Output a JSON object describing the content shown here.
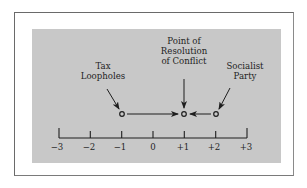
{
  "diagram": {
    "type": "number-line",
    "axis": {
      "ticks": [
        {
          "value": -3,
          "label": "−3"
        },
        {
          "value": -2,
          "label": "−2"
        },
        {
          "value": -1,
          "label": "−1"
        },
        {
          "value": 0,
          "label": "0"
        },
        {
          "value": 1,
          "label": "+1"
        },
        {
          "value": 2,
          "label": "+2"
        },
        {
          "value": 3,
          "label": "+3"
        }
      ]
    },
    "points": [
      {
        "id": "tax-loopholes",
        "position": -1,
        "label_line1": "Tax",
        "label_line2": "Loopholes"
      },
      {
        "id": "resolution",
        "position": 1,
        "label_line1": "Point of",
        "label_line2": "Resolution",
        "label_line3": "of Conflict"
      },
      {
        "id": "socialist-party",
        "position": 2,
        "label_line1": "Socialist",
        "label_line2": "Party"
      }
    ],
    "arrows": [
      {
        "from": -1,
        "to": 1,
        "direction": "right"
      },
      {
        "from": 2,
        "to": 1,
        "direction": "left"
      }
    ],
    "colors": {
      "panel": "#c8c8c8",
      "ink": "#1e1e1e",
      "frame": "#6a6a6a"
    }
  }
}
